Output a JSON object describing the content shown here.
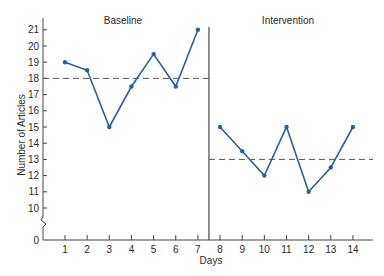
{
  "chart_data": {
    "type": "line",
    "title": "",
    "xlabel": "Days",
    "ylabel": "Number of Articles",
    "ylim": [
      0,
      21
    ],
    "y_ticks": [
      0,
      10,
      11,
      12,
      13,
      14,
      15,
      16,
      17,
      18,
      19,
      20,
      21
    ],
    "y_axis_break": "between 0 and 10",
    "x_ticks": [
      1,
      2,
      3,
      4,
      5,
      6,
      7,
      8,
      9,
      10,
      11,
      12,
      13,
      14
    ],
    "grid": false,
    "legend": null,
    "phases": [
      {
        "name": "Baseline",
        "x": [
          1,
          2,
          3,
          4,
          5,
          6,
          7
        ],
        "values": [
          19,
          18.5,
          15,
          17.5,
          19.5,
          17.5,
          21
        ],
        "mean_line": 18
      },
      {
        "name": "Intervention",
        "x": [
          8,
          9,
          10,
          11,
          12,
          13,
          14
        ],
        "values": [
          15,
          13.5,
          12,
          15,
          11,
          12.5,
          15
        ],
        "mean_line": 13
      }
    ],
    "phase_change_after_day": 7,
    "colors": {
      "series": "#2f5f93",
      "axis": "#444444",
      "mean_line": "#555555"
    }
  },
  "labels": {
    "xlabel": "Days",
    "ylabel": "Number of Articles",
    "phase1": "Baseline",
    "phase2": "Intervention"
  }
}
